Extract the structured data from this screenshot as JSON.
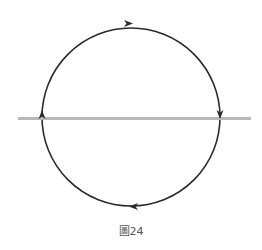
{
  "figure": {
    "caption": "圖24",
    "circle": {
      "cx": 131,
      "cy": 117,
      "r": 89,
      "stroke": "#2a2a2a"
    },
    "axis_line": {
      "x1": 18,
      "x2": 251,
      "y": 118,
      "stroke": "#b8b8b8"
    },
    "arrows": [
      {
        "position": "top",
        "direction": "right"
      },
      {
        "position": "right",
        "direction": "down"
      },
      {
        "position": "bottom",
        "direction": "left"
      },
      {
        "position": "left",
        "direction": "up"
      }
    ]
  }
}
